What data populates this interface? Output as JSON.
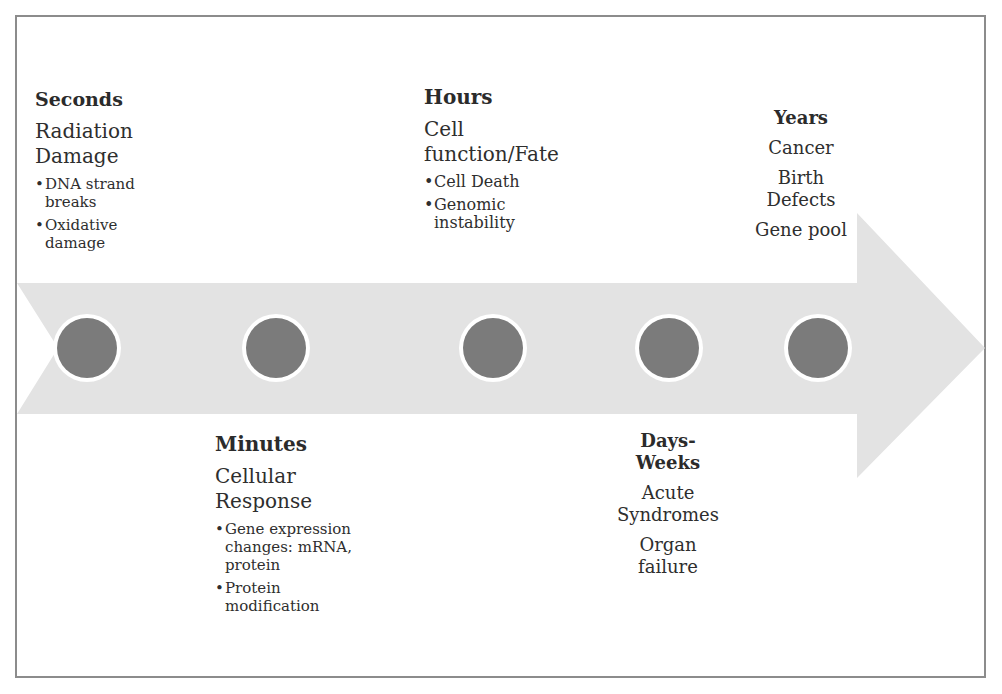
{
  "diagram": {
    "type": "timeline",
    "colors": {
      "frame_border": "#8c8c8c",
      "arrow_fill": "#e3e3e3",
      "node_fill": "#7b7b7b",
      "node_ring": "#ffffff",
      "text": "#2b2b2b"
    },
    "nodes": [
      {
        "id": "seconds",
        "icon": "circle-node"
      },
      {
        "id": "minutes",
        "icon": "circle-node"
      },
      {
        "id": "hours",
        "icon": "circle-node"
      },
      {
        "id": "days-weeks",
        "icon": "circle-node"
      },
      {
        "id": "years",
        "icon": "circle-node"
      }
    ],
    "stages": {
      "seconds": {
        "title": "Seconds",
        "subtitle_line1": "Radiation",
        "subtitle_line2": "Damage",
        "bullets": [
          "DNA strand breaks",
          "Oxidative damage"
        ]
      },
      "minutes": {
        "title": "Minutes",
        "subtitle_line1": "Cellular",
        "subtitle_line2": "Response",
        "bullets": [
          "Gene expression changes: mRNA, protein",
          "Protein modification"
        ]
      },
      "hours": {
        "title": "Hours",
        "subtitle_line1": "Cell",
        "subtitle_line2": "function/Fate",
        "bullets": [
          "Cell Death",
          "Genomic instability"
        ]
      },
      "days_weeks": {
        "title_line1": "Days-",
        "title_line2": "Weeks",
        "items": [
          "Acute Syndromes",
          "Organ failure"
        ]
      },
      "years": {
        "title": "Years",
        "items": [
          "Cancer",
          "Birth Defects",
          "Gene pool"
        ]
      }
    }
  }
}
